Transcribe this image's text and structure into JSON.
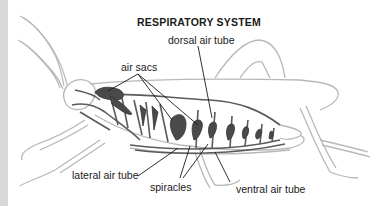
{
  "diagram": {
    "title": "RESPIRATORY SYSTEM",
    "labels": {
      "dorsal_air_tube": "dorsal air tube",
      "air_sacs": "air sacs",
      "lateral_air_tube": "lateral air tube",
      "spiracles": "spiracles",
      "ventral_air_tube": "ventral air tube"
    },
    "colors": {
      "background": "#ffffff",
      "left_strip": "#d9d9d9",
      "outline": "#b8b8b8",
      "tracheae": "#5a5a5a",
      "air_sacs": "#4a4a4a",
      "leader_lines": "#1a1a1a",
      "text": "#1a1a1a"
    }
  }
}
